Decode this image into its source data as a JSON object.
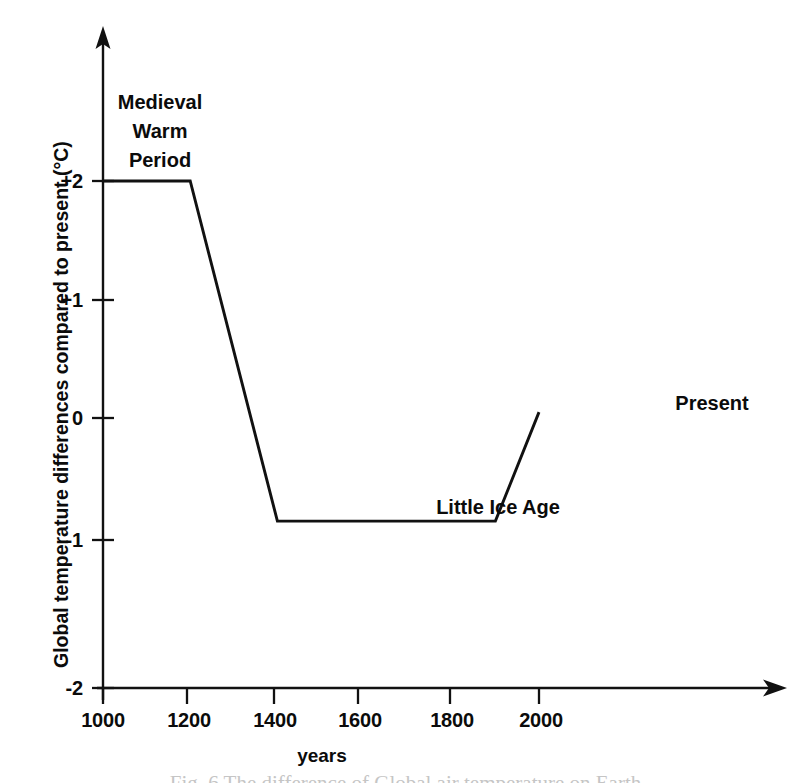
{
  "figure": {
    "background_color": "#ffffff",
    "ink_color": "#111111",
    "caption_partial": "Fig. 6    The difference of Global air temperature on Earth"
  },
  "chart_data": {
    "type": "line",
    "title": "",
    "subtitle": "",
    "xlabel": "years",
    "ylabel": "Global temperature differences compared to present (°C)",
    "xlim": [
      1000,
      2100
    ],
    "ylim": [
      -2,
      2.6
    ],
    "grid": false,
    "legend": "none",
    "x_ticks": [
      1000,
      1200,
      1400,
      1600,
      1800,
      2000
    ],
    "x_tick_labels": [
      "1000",
      "1200",
      "1400",
      "1600",
      "1800",
      "2000"
    ],
    "y_ticks": [
      2,
      1,
      0,
      -1,
      -2
    ],
    "y_tick_labels": [
      "+2",
      "+1",
      "0",
      "-1",
      "-2"
    ],
    "axis_style": "arrowed-open",
    "series": [
      {
        "name": "Global temperature difference",
        "x": [
          1000,
          1200,
          1400,
          1900,
          2000
        ],
        "y": [
          2.0,
          2.0,
          -0.87,
          -0.87,
          0.05
        ]
      }
    ],
    "annotations": [
      {
        "id": "medieval-warm-period",
        "lines": [
          "Medieval",
          "Warm",
          "Period"
        ],
        "text": "Medieval Warm Period",
        "x": 1160,
        "y": 2.55
      },
      {
        "id": "little-ice-age",
        "lines": [
          "Little Ice Age"
        ],
        "text": "Little Ice Age",
        "x": 1640,
        "y": -0.68
      },
      {
        "id": "present",
        "lines": [
          "Present"
        ],
        "text": "Present",
        "x": 2050,
        "y": 0.35
      }
    ]
  },
  "axis_titles": {
    "x": "years",
    "y": "Global temperature differences compared to present (°C)"
  },
  "y_tick_labels": {
    "t0": "+2",
    "t1": "+1",
    "t2": "0",
    "t3": "-1",
    "t4": "-2"
  },
  "x_tick_labels": {
    "t0": "1000",
    "t1": "1200",
    "t2": "1400",
    "t3": "1600",
    "t4": "1800",
    "t5": "2000"
  },
  "annotations": {
    "medieval_line1": "Medieval",
    "medieval_line2": "Warm",
    "medieval_line3": "Period",
    "little_ice_age": "Little Ice Age",
    "present": "Present"
  }
}
